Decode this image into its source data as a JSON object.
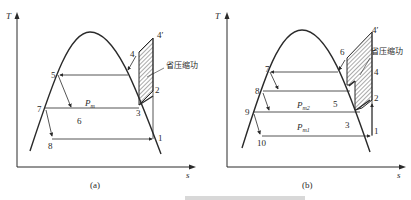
{
  "figure": {
    "panels": [
      {
        "id": "a",
        "caption": "(a)",
        "axis_y": "T",
        "axis_x": "s",
        "hatch_label": "省压缩功",
        "pressure_label": "P",
        "pressure_sub": "m",
        "points": [
          "1",
          "2",
          "3",
          "4",
          "4′",
          "5",
          "6",
          "7",
          "8"
        ]
      },
      {
        "id": "b",
        "caption": "(b)",
        "axis_y": "T",
        "axis_x": "s",
        "hatch_label": "省压缩功",
        "pressure_labels": [
          {
            "main": "P",
            "sub": "m2"
          },
          {
            "main": "P",
            "sub": "m1"
          }
        ],
        "points": [
          "1",
          "2",
          "3",
          "4",
          "4′",
          "5",
          "6",
          "7",
          "8",
          "9",
          "10"
        ]
      }
    ],
    "bottom_caption": ""
  },
  "colors": {
    "line": "#2a2a2a",
    "background": "#ffffff"
  }
}
